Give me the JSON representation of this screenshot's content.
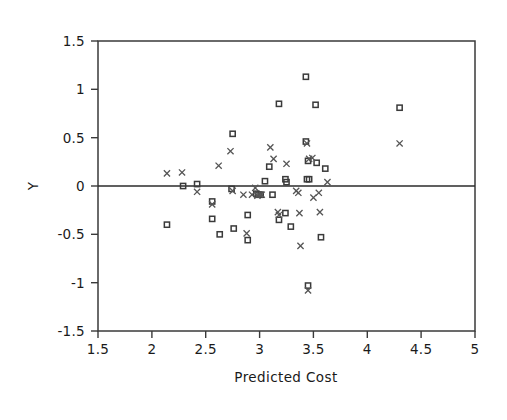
{
  "chart_data": {
    "type": "scatter",
    "title": "",
    "xlabel": "Predicted Cost",
    "ylabel": "Y",
    "xlim": [
      1.5,
      5
    ],
    "ylim": [
      -1.5,
      1.5
    ],
    "xticks": [
      1.5,
      2,
      2.5,
      3,
      3.5,
      4,
      4.5,
      5
    ],
    "xticklabels": [
      "1.5",
      "2",
      "2.5",
      "3",
      "3.5",
      "4",
      "4.5",
      "5"
    ],
    "yticks": [
      1.5,
      1,
      0.5,
      0,
      -0.5,
      -1,
      -1.5
    ],
    "yticklabels": [
      "1.5",
      "1",
      "0.5",
      "0",
      "-0.5",
      "-1",
      "-1.5"
    ],
    "grid": false,
    "legend": null,
    "reference_line": {
      "axis": "y",
      "value": 0
    },
    "series": [
      {
        "name": "square",
        "marker": "open-square",
        "color": "#3a3a3a",
        "points": [
          [
            2.29,
            0.0
          ],
          [
            2.42,
            0.02
          ],
          [
            2.14,
            -0.4
          ],
          [
            2.56,
            -0.16
          ],
          [
            2.56,
            -0.34
          ],
          [
            2.63,
            -0.5
          ],
          [
            2.75,
            0.54
          ],
          [
            2.74,
            -0.03
          ],
          [
            2.76,
            -0.44
          ],
          [
            2.89,
            -0.3
          ],
          [
            2.89,
            -0.56
          ],
          [
            2.97,
            -0.08
          ],
          [
            2.99,
            -0.09
          ],
          [
            3.01,
            -0.09
          ],
          [
            3.05,
            0.05
          ],
          [
            3.09,
            0.2
          ],
          [
            3.12,
            -0.09
          ],
          [
            3.18,
            0.85
          ],
          [
            3.18,
            -0.35
          ],
          [
            3.24,
            0.07
          ],
          [
            3.25,
            0.04
          ],
          [
            3.24,
            -0.28
          ],
          [
            3.29,
            -0.42
          ],
          [
            3.43,
            1.13
          ],
          [
            3.43,
            0.46
          ],
          [
            3.45,
            0.26
          ],
          [
            3.44,
            0.07
          ],
          [
            3.46,
            0.07
          ],
          [
            3.45,
            -1.03
          ],
          [
            3.52,
            0.84
          ],
          [
            3.53,
            0.24
          ],
          [
            3.57,
            -0.53
          ],
          [
            3.61,
            0.18
          ],
          [
            4.3,
            0.81
          ]
        ]
      },
      {
        "name": "cross",
        "marker": "x",
        "color": "#555555",
        "points": [
          [
            2.14,
            0.13
          ],
          [
            2.28,
            0.14
          ],
          [
            2.42,
            -0.06
          ],
          [
            2.56,
            -0.19
          ],
          [
            2.62,
            0.21
          ],
          [
            2.73,
            0.36
          ],
          [
            2.75,
            -0.05
          ],
          [
            2.85,
            -0.09
          ],
          [
            2.88,
            -0.49
          ],
          [
            2.93,
            -0.09
          ],
          [
            2.96,
            -0.02
          ],
          [
            2.98,
            -0.1
          ],
          [
            3.0,
            -0.09
          ],
          [
            3.02,
            -0.09
          ],
          [
            3.1,
            0.4
          ],
          [
            3.13,
            0.28
          ],
          [
            3.17,
            -0.27
          ],
          [
            3.18,
            -0.3
          ],
          [
            3.25,
            0.23
          ],
          [
            3.34,
            -0.05
          ],
          [
            3.36,
            -0.07
          ],
          [
            3.37,
            -0.28
          ],
          [
            3.38,
            -0.62
          ],
          [
            3.44,
            0.44
          ],
          [
            3.46,
            0.28
          ],
          [
            3.49,
            0.29
          ],
          [
            3.5,
            -0.12
          ],
          [
            3.45,
            -1.08
          ],
          [
            3.55,
            -0.07
          ],
          [
            3.56,
            -0.27
          ],
          [
            3.63,
            0.04
          ],
          [
            4.3,
            0.44
          ]
        ]
      }
    ]
  },
  "figure": {
    "plot_left_px": 98,
    "plot_top_px": 41,
    "plot_right_px": 475,
    "plot_bottom_px": 331
  }
}
